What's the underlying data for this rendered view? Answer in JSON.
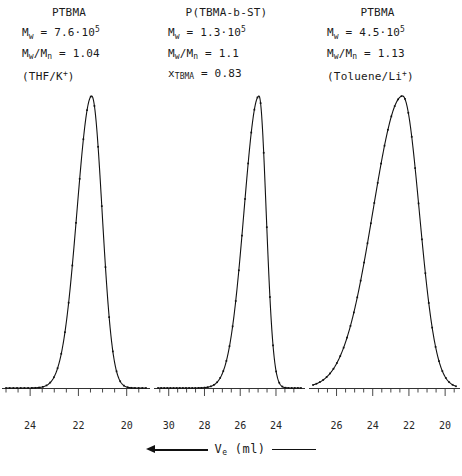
{
  "figure": {
    "xaxis_label": "V",
    "xaxis_label_sub": "e",
    "xaxis_units": "(ml)",
    "arrow_icon": "arrow-left-icon",
    "tail_icon": "line-segment-icon"
  },
  "chart_data": {
    "type": "line",
    "xlabel": "V_e (ml)",
    "ylabel": "",
    "x_axis_direction": "decreasing-left-to-right",
    "grid": false,
    "legend": "none",
    "panels": [
      {
        "id": "panel-ptbma-thf-k",
        "sample": "PTBMA",
        "annotations": {
          "mw_label": "M",
          "mw_sub": "w",
          "mw_eq": "=",
          "mw_value": "7.6·10",
          "mw_exp": "5",
          "pdi_num": "M",
          "pdi_num_sub": "w",
          "pdi_slash": "/M",
          "pdi_den_sub": "n",
          "pdi_eq": "=",
          "pdi_value": "1.04",
          "solvent": "(THF/K",
          "solvent_sup": "+",
          "solvent_close": ")"
        },
        "xlim": [
          25.0,
          19.2
        ],
        "ticks": [
          24,
          22,
          20
        ],
        "minor_tick_step": 0.5,
        "peak_center": 21.45,
        "peak_width": 0.43,
        "peak_skew": 0.16,
        "peak_height": 1.0,
        "n_markers": 38
      },
      {
        "id": "panel-tbma-b-st",
        "sample": "P(TBMA-b-ST)",
        "annotations": {
          "mw_label": "M",
          "mw_sub": "w",
          "mw_eq": "=",
          "mw_value": "1.3·10",
          "mw_exp": "5",
          "pdi_num": "M",
          "pdi_num_sub": "w",
          "pdi_slash": "/M",
          "pdi_den_sub": "n",
          "pdi_eq": "=",
          "pdi_value": "1.1",
          "frac_label": "x",
          "frac_sub": "TBMA",
          "frac_eq": "=",
          "frac_value": "0.83"
        },
        "xlim": [
          30.6,
          22.6
        ],
        "ticks": [
          30,
          28,
          26,
          24
        ],
        "minor_tick_step": 0.5,
        "peak_center": 24.95,
        "peak_width": 0.4,
        "peak_skew": 0.42,
        "peak_height": 1.0,
        "n_markers": 46
      },
      {
        "id": "panel-ptbma-toluene-li",
        "sample": "PTBMA",
        "annotations": {
          "mw_label": "M",
          "mw_sub": "w",
          "mw_eq": "=",
          "mw_value": "4.5·10",
          "mw_exp": "5",
          "pdi_num": "M",
          "pdi_num_sub": "w",
          "pdi_slash": "/M",
          "pdi_den_sub": "n",
          "pdi_eq": "=",
          "pdi_value": "1.13",
          "solvent": "(Toluene/Li",
          "solvent_sup": "+",
          "solvent_close": ")"
        },
        "xlim": [
          27.3,
          19.4
        ],
        "ticks": [
          26,
          24,
          22,
          20
        ],
        "minor_tick_step": 0.5,
        "peak_center": 22.35,
        "peak_width": 0.92,
        "peak_skew": 0.3,
        "peak_height": 1.0,
        "n_markers": 42
      }
    ]
  },
  "colors": {
    "curve": "#111111",
    "axis": "#333333",
    "text": "#1a1a1a",
    "background": "#ffffff"
  }
}
